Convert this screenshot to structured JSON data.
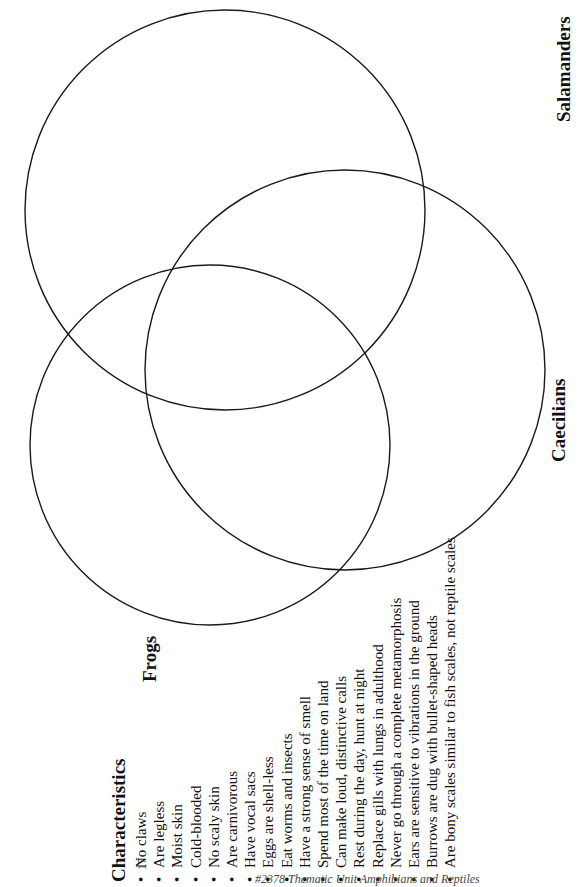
{
  "diagram": {
    "type": "venn",
    "orientation": "rotated-90-ccw",
    "circles": [
      {
        "name": "Salamanders",
        "cx": 225,
        "cy": 210,
        "r": 200
      },
      {
        "name": "Caecilians",
        "cx": 345,
        "cy": 370,
        "r": 200
      },
      {
        "name": "Frogs",
        "cx": 210,
        "cy": 445,
        "r": 180
      }
    ],
    "labels": {
      "salamanders": "Salamanders",
      "caecilians": "Caecilians",
      "frogs": "Frogs"
    },
    "stroke_color": "#1a1a1a"
  },
  "characteristics": {
    "title": "Characteristics",
    "bullet": "•",
    "items": [
      "No claws",
      "Are legless",
      "Moist skin",
      "Cold-blooded",
      "No scaly skin",
      "Are carnivorous",
      "Have vocal sacs",
      "Eggs are shell-less",
      "Eat worms and insects",
      "Have a strong sense of smell",
      "Spend most of the time on land",
      "Can make loud, distinctive calls",
      "Rest during the day, hunt at night",
      "Replace gills with lungs in adulthood",
      "Never go through a complete metamorphosis",
      "Ears are sensitive to vibrations in the ground",
      "Burrows are dug with bullet-shaped heads",
      "Are bony scales similar to fish scales, not reptile scales"
    ]
  },
  "footer": {
    "page_number": "17",
    "source": "#2378 Thematic Unit Amphibians and Reptiles"
  }
}
